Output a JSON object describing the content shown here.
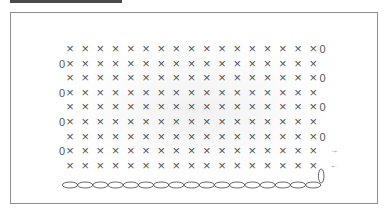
{
  "diagram": {
    "title_bar_color": "#4a4a4a",
    "frame_color": "#8e8e8e",
    "stitch_color": "#555555",
    "stitch_symbol": "×",
    "turning_chain_symbol": "0",
    "arrow_right": "→",
    "arrow_left": "←",
    "stitches_per_row": 17,
    "chain_count": 17,
    "rows": [
      {
        "index": 1,
        "zero_side": "right",
        "arrow": ""
      },
      {
        "index": 2,
        "zero_side": "left",
        "arrow": ""
      },
      {
        "index": 3,
        "zero_side": "right",
        "arrow": ""
      },
      {
        "index": 4,
        "zero_side": "left",
        "arrow": ""
      },
      {
        "index": 5,
        "zero_side": "right",
        "arrow": ""
      },
      {
        "index": 6,
        "zero_side": "left",
        "arrow": ""
      },
      {
        "index": 7,
        "zero_side": "right",
        "arrow": ""
      },
      {
        "index": 8,
        "zero_side": "left",
        "arrow": "→"
      },
      {
        "index": 9,
        "zero_side": "loop",
        "arrow": "←"
      }
    ]
  }
}
